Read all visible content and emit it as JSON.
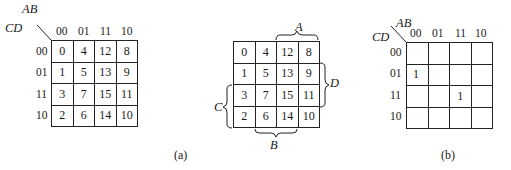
{
  "figure_a": {
    "row_var": "CD",
    "col_var": "AB",
    "col_labels": [
      "00",
      "01",
      "11",
      "10"
    ],
    "row_labels": [
      "00",
      "01",
      "11",
      "10"
    ],
    "cells": [
      [
        "0",
        "4",
        "12",
        "8"
      ],
      [
        "1",
        "5",
        "13",
        "9"
      ],
      [
        "3",
        "7",
        "15",
        "11"
      ],
      [
        "2",
        "6",
        "14",
        "10"
      ]
    ]
  },
  "figure_a2": {
    "cells": [
      [
        "0",
        "4",
        "12",
        "8"
      ],
      [
        "1",
        "5",
        "13",
        "9"
      ],
      [
        "3",
        "7",
        "15",
        "11"
      ],
      [
        "2",
        "6",
        "14",
        "10"
      ]
    ],
    "brace_labels": {
      "top": "A",
      "right": "D",
      "left": "C",
      "bottom": "B"
    },
    "caption": "(a)"
  },
  "figure_b": {
    "row_var": "CD",
    "col_var": "AB",
    "col_labels": [
      "00",
      "01",
      "11",
      "10"
    ],
    "row_labels": [
      "00",
      "01",
      "11",
      "10"
    ],
    "cells": [
      [
        "",
        "",
        "",
        ""
      ],
      [
        "1",
        "",
        "",
        ""
      ],
      [
        "",
        "",
        "1",
        ""
      ],
      [
        "",
        "",
        "",
        ""
      ]
    ],
    "caption": "(b)"
  }
}
